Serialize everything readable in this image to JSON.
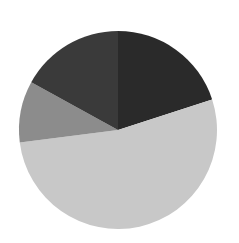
{
  "chart_data": {
    "type": "pie",
    "title": "",
    "start_angle_deg": 0,
    "direction": "clockwise",
    "labels": [
      "",
      "",
      "",
      ""
    ],
    "values": [
      20,
      53,
      10,
      17
    ],
    "colors": [
      "#2a2a2a",
      "#c8c8c8",
      "#8c8c8c",
      "#3a3a3a"
    ],
    "legend": "none",
    "center": [
      118,
      130
    ],
    "radius": 99
  }
}
